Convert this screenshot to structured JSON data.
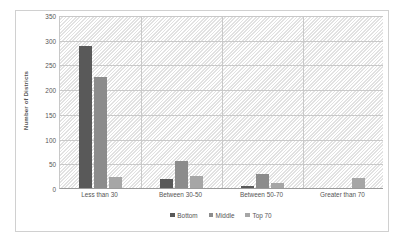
{
  "chart_data": {
    "type": "bar",
    "title": "",
    "subtitle": "",
    "xlabel": "",
    "ylabel": "Number of Districts",
    "ylim": [
      0,
      350
    ],
    "ytick_step": 50,
    "yticks": [
      "350",
      "300",
      "250",
      "200",
      "150",
      "100",
      "50",
      "0"
    ],
    "ytick_values": [
      350,
      300,
      250,
      200,
      150,
      100,
      50,
      0
    ],
    "grid": "horizontal-and-category-separators",
    "legend_position": "bottom-center",
    "categories": [
      "Less than 30",
      "Between 30-50",
      "Between 50-70",
      "Greater than 70"
    ],
    "series": [
      {
        "name": "Bottom",
        "color": "#595959",
        "values": [
          287,
          18,
          4,
          0
        ]
      },
      {
        "name": "Middle",
        "color": "#8c8c8c",
        "values": [
          225,
          55,
          28,
          0
        ]
      },
      {
        "name": "Top 70",
        "color": "#a6a6a6",
        "values": [
          22,
          25,
          10,
          20
        ]
      }
    ]
  },
  "colors": {
    "frame_border": "#d0d0d0",
    "gridline": "#c9c9c9",
    "axis_line": "#9a9a9a",
    "text": "#555555",
    "plot_hatch": "#e2e2e2"
  }
}
